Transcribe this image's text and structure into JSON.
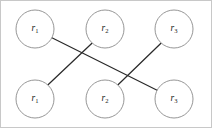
{
  "figure": {
    "type": "bipartite-graph-diagram",
    "width": 212,
    "height": 128,
    "background_color": "#ffffff",
    "border_color": "#c8c8c8",
    "node_fill": "#ffffff",
    "node_stroke": "#8a8a8a",
    "edge_color": "#2b2b2b",
    "label_color": "#1a1a1a"
  },
  "nodes": [
    {
      "id": "top-r1",
      "row": "top",
      "column": 1,
      "base": "r",
      "subscript": "1",
      "label": "r1",
      "cx": 35,
      "cy": 29,
      "r": 19
    },
    {
      "id": "top-r2",
      "row": "top",
      "column": 2,
      "base": "r",
      "subscript": "2",
      "label": "r2",
      "cx": 105,
      "cy": 29,
      "r": 19
    },
    {
      "id": "top-r3",
      "row": "top",
      "column": 3,
      "base": "r",
      "subscript": "3",
      "label": "r3",
      "cx": 174,
      "cy": 29,
      "r": 19
    },
    {
      "id": "bottom-r1",
      "row": "bottom",
      "column": 1,
      "base": "r",
      "subscript": "1",
      "label": "r1",
      "cx": 35,
      "cy": 99,
      "r": 19
    },
    {
      "id": "bottom-r2",
      "row": "bottom",
      "column": 2,
      "base": "r",
      "subscript": "2",
      "label": "r2",
      "cx": 105,
      "cy": 99,
      "r": 19
    },
    {
      "id": "bottom-r3",
      "row": "bottom",
      "column": 3,
      "base": "r",
      "subscript": "3",
      "label": "r3",
      "cx": 174,
      "cy": 99,
      "r": 19
    }
  ],
  "edges": [
    {
      "id": "edge-top-r1-to-bottom-r3",
      "from": "top-r1",
      "to": "bottom-r3",
      "x1": 51.9,
      "y1": 37.7,
      "x2": 157.1,
      "y2": 90.3
    },
    {
      "id": "edge-top-r2-to-bottom-r1",
      "from": "top-r2",
      "to": "bottom-r1",
      "x1": 92.2,
      "y1": 43.0,
      "x2": 47.8,
      "y2": 85.0
    },
    {
      "id": "edge-top-r3-to-bottom-r2",
      "from": "top-r3",
      "to": "bottom-r2",
      "x1": 161.2,
      "y1": 43.0,
      "x2": 117.8,
      "y2": 85.0
    }
  ]
}
